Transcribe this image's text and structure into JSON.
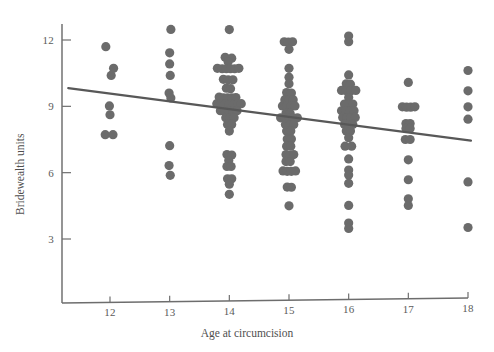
{
  "chart_data": {
    "type": "scatter",
    "title": "",
    "xlabel": "Age at circumcision",
    "ylabel": "Bridewealth units",
    "xlim": [
      11.3,
      18.1
    ],
    "ylim": [
      1.2,
      13.2
    ],
    "xticks": [
      12,
      13,
      14,
      15,
      16,
      17,
      18
    ],
    "xticklabels": [
      "12",
      "13",
      "14",
      "15",
      "16",
      "17",
      "18"
    ],
    "yticks": [
      3,
      6,
      9,
      12
    ],
    "yticklabels": [
      "3",
      "6",
      "9",
      "12"
    ],
    "grid": false,
    "legend": null,
    "marker_color": "#6b6b6b",
    "line_color": "#585858",
    "axis_color": "#6f6f6f",
    "marker_size": 4.6,
    "fit_line": {
      "label": "linear regression",
      "x": [
        11.3,
        18.05
      ],
      "y": [
        9.82,
        7.45
      ]
    },
    "series": [
      {
        "name": "Bridewealth by age at circumcision",
        "points": [
          [
            11.93,
            11.7
          ],
          [
            12.06,
            10.72
          ],
          [
            12.02,
            10.4
          ],
          [
            11.99,
            9.02
          ],
          [
            12.0,
            8.62
          ],
          [
            11.92,
            7.72
          ],
          [
            12.05,
            7.72
          ],
          [
            13.02,
            12.48
          ],
          [
            13.0,
            11.42
          ],
          [
            13.0,
            10.92
          ],
          [
            13.01,
            10.4
          ],
          [
            12.99,
            9.6
          ],
          [
            13.02,
            9.38
          ],
          [
            13.0,
            7.22
          ],
          [
            12.99,
            6.32
          ],
          [
            13.01,
            5.88
          ],
          [
            14.0,
            12.47
          ],
          [
            13.93,
            11.22
          ],
          [
            14.04,
            11.18
          ],
          [
            13.98,
            11.02
          ],
          [
            13.8,
            10.72
          ],
          [
            13.88,
            10.7
          ],
          [
            13.95,
            10.7
          ],
          [
            14.02,
            10.7
          ],
          [
            14.09,
            10.7
          ],
          [
            14.16,
            10.72
          ],
          [
            13.9,
            10.22
          ],
          [
            13.98,
            10.2
          ],
          [
            14.06,
            10.2
          ],
          [
            13.95,
            9.82
          ],
          [
            14.02,
            9.8
          ],
          [
            13.83,
            9.42
          ],
          [
            13.9,
            9.38
          ],
          [
            13.97,
            9.38
          ],
          [
            14.04,
            9.38
          ],
          [
            14.11,
            9.4
          ],
          [
            13.79,
            9.12
          ],
          [
            13.86,
            9.1
          ],
          [
            13.93,
            9.1
          ],
          [
            14.0,
            9.08
          ],
          [
            14.07,
            9.08
          ],
          [
            14.14,
            9.1
          ],
          [
            14.2,
            9.12
          ],
          [
            13.85,
            8.8
          ],
          [
            13.92,
            8.78
          ],
          [
            13.99,
            8.78
          ],
          [
            14.06,
            8.78
          ],
          [
            14.13,
            8.8
          ],
          [
            13.94,
            8.48
          ],
          [
            14.01,
            8.46
          ],
          [
            14.08,
            8.48
          ],
          [
            13.97,
            8.18
          ],
          [
            14.04,
            8.18
          ],
          [
            14.0,
            7.88
          ],
          [
            13.96,
            6.82
          ],
          [
            14.04,
            6.8
          ],
          [
            13.99,
            6.55
          ],
          [
            13.96,
            6.28
          ],
          [
            14.03,
            6.28
          ],
          [
            13.97,
            5.72
          ],
          [
            14.04,
            5.72
          ],
          [
            14.0,
            5.48
          ],
          [
            14.0,
            5.02
          ],
          [
            14.92,
            11.92
          ],
          [
            14.99,
            11.9
          ],
          [
            15.06,
            11.92
          ],
          [
            15.0,
            11.58
          ],
          [
            15.0,
            10.72
          ],
          [
            15.0,
            10.32
          ],
          [
            15.0,
            10.02
          ],
          [
            14.96,
            9.62
          ],
          [
            15.04,
            9.6
          ],
          [
            14.93,
            9.3
          ],
          [
            15.0,
            9.28
          ],
          [
            15.07,
            9.3
          ],
          [
            14.89,
            9.02
          ],
          [
            14.96,
            9.0
          ],
          [
            15.03,
            9.0
          ],
          [
            15.1,
            9.02
          ],
          [
            14.95,
            8.7
          ],
          [
            15.02,
            8.68
          ],
          [
            14.86,
            8.48
          ],
          [
            14.93,
            8.46
          ],
          [
            15.0,
            8.46
          ],
          [
            15.07,
            8.46
          ],
          [
            15.14,
            8.48
          ],
          [
            14.94,
            8.18
          ],
          [
            15.01,
            8.16
          ],
          [
            15.08,
            8.18
          ],
          [
            14.96,
            7.88
          ],
          [
            15.03,
            7.88
          ],
          [
            14.97,
            7.52
          ],
          [
            15.04,
            7.52
          ],
          [
            14.96,
            7.2
          ],
          [
            15.03,
            7.2
          ],
          [
            14.95,
            6.82
          ],
          [
            15.02,
            6.8
          ],
          [
            15.08,
            6.82
          ],
          [
            14.95,
            6.5
          ],
          [
            15.02,
            6.5
          ],
          [
            14.9,
            6.08
          ],
          [
            14.97,
            6.06
          ],
          [
            15.04,
            6.06
          ],
          [
            15.11,
            6.08
          ],
          [
            14.97,
            5.35
          ],
          [
            15.04,
            5.34
          ],
          [
            15.0,
            4.5
          ],
          [
            16.0,
            12.18
          ],
          [
            16.0,
            11.92
          ],
          [
            16.0,
            10.42
          ],
          [
            15.96,
            10.02
          ],
          [
            16.03,
            10.0
          ],
          [
            15.88,
            9.72
          ],
          [
            15.96,
            9.7
          ],
          [
            16.04,
            9.7
          ],
          [
            16.12,
            9.72
          ],
          [
            16.0,
            9.4
          ],
          [
            15.93,
            9.1
          ],
          [
            16.0,
            9.08
          ],
          [
            16.07,
            9.1
          ],
          [
            15.88,
            8.8
          ],
          [
            15.95,
            8.78
          ],
          [
            16.02,
            8.78
          ],
          [
            16.09,
            8.8
          ],
          [
            15.9,
            8.5
          ],
          [
            15.97,
            8.48
          ],
          [
            16.04,
            8.48
          ],
          [
            16.11,
            8.5
          ],
          [
            15.93,
            8.18
          ],
          [
            16.0,
            8.16
          ],
          [
            16.07,
            8.18
          ],
          [
            15.96,
            7.88
          ],
          [
            16.03,
            7.88
          ],
          [
            16.0,
            7.58
          ],
          [
            15.94,
            7.2
          ],
          [
            16.05,
            7.2
          ],
          [
            16.0,
            6.62
          ],
          [
            16.0,
            6.12
          ],
          [
            16.0,
            5.9
          ],
          [
            16.0,
            5.52
          ],
          [
            16.0,
            4.52
          ],
          [
            16.0,
            3.72
          ],
          [
            16.0,
            3.48
          ],
          [
            17.0,
            10.08
          ],
          [
            16.9,
            8.98
          ],
          [
            16.97,
            8.96
          ],
          [
            17.04,
            8.96
          ],
          [
            17.11,
            8.98
          ],
          [
            16.96,
            8.22
          ],
          [
            17.03,
            8.22
          ],
          [
            16.96,
            8.0
          ],
          [
            17.03,
            8.0
          ],
          [
            16.95,
            7.5
          ],
          [
            17.03,
            7.5
          ],
          [
            17.0,
            6.58
          ],
          [
            17.0,
            5.68
          ],
          [
            17.0,
            4.82
          ],
          [
            17.0,
            4.52
          ],
          [
            18.0,
            10.62
          ],
          [
            18.0,
            9.7
          ],
          [
            18.0,
            8.98
          ],
          [
            18.0,
            8.42
          ],
          [
            18.0,
            5.58
          ],
          [
            18.0,
            3.52
          ]
        ]
      }
    ]
  },
  "axes": {
    "y_title": "Bridewealth units",
    "x_title": "Age at circumcision"
  }
}
